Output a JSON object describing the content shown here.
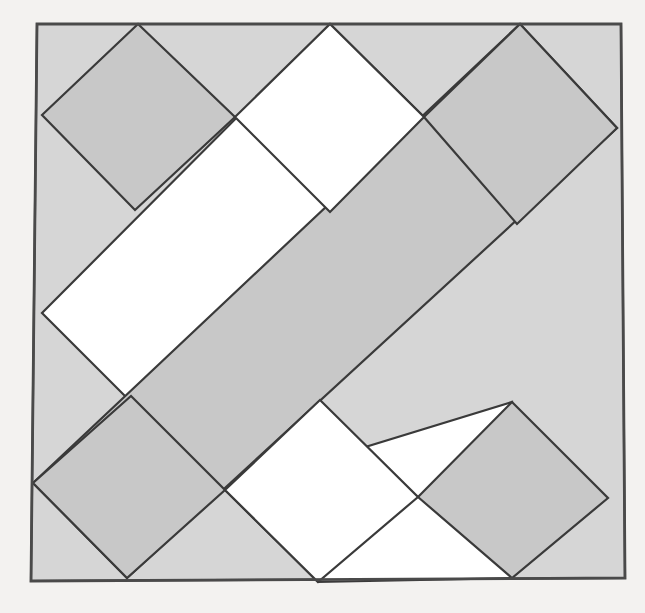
{
  "figure": {
    "kind": "geometric-diagram",
    "canvas": {
      "width": 645,
      "height": 613
    },
    "background_color": "#f3f2f0",
    "colors": {
      "page_background": "#f3f2f0",
      "light_gray_fill": "#d6d6d6",
      "medium_gray_fill": "#c8c8c8",
      "white_fill": "#ffffff",
      "stroke": "#3a3a3a",
      "outer_stroke": "#4a4a4a"
    },
    "stroke_width": 2.2,
    "outer_square": {
      "label": "outer tilted square",
      "fill": "#d6d6d6",
      "points": "37,24 621,24 625,578 31,581"
    },
    "bands": [
      {
        "label": "upper white band",
        "fill": "#ffffff",
        "points": "330,24 42,313 135,406 424,117"
      },
      {
        "label": "central gray band",
        "fill": "#c8c8c8",
        "points": "520,24 33,483 127,578 617,128"
      },
      {
        "label": "lower white band",
        "fill": "#ffffff",
        "points": "225,490 318,582 512,578 512,402"
      }
    ],
    "corner_diamonds": [
      {
        "label": "top-left diamond",
        "fill": "#c8c8c8",
        "points": "42,115 138,24 235,117 135,210"
      },
      {
        "label": "top-right diamond",
        "fill": "#c8c8c8",
        "points": "424,117 520,24 617,128 517,224"
      },
      {
        "label": "bottom-left diamond",
        "fill": "#c8c8c8",
        "points": "33,483 127,578 225,490 131,396"
      },
      {
        "label": "bottom-right diamond",
        "fill": "#c8c8c8",
        "points": "418,497 512,402 608,498 512,578"
      }
    ],
    "inner_white_diamonds": [
      {
        "label": "upper inner white diamond",
        "fill": "#ffffff",
        "points": "235,117 330,24 424,117 330,212"
      },
      {
        "label": "lower inner white diamond",
        "fill": "#ffffff",
        "points": "225,490 318,582 418,497 320,400"
      }
    ],
    "edge_lines": [
      {
        "label": "outer-left-edge",
        "points": "37,24 31,581"
      },
      {
        "label": "outer-top-edge",
        "points": "37,24 621,24"
      },
      {
        "label": "outer-right-edge",
        "points": "621,24 625,578"
      },
      {
        "label": "outer-bottom-edge",
        "points": "31,581 625,578"
      }
    ]
  }
}
